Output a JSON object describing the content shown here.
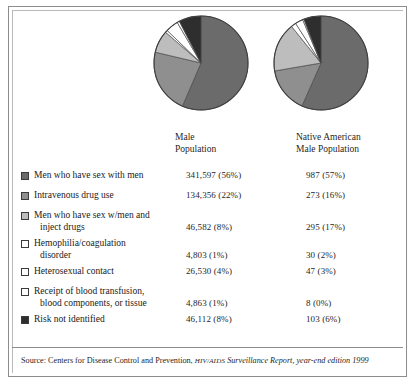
{
  "columns": {
    "male": {
      "line1": "Male",
      "line2": "Population"
    },
    "native_american": {
      "line1": "Native American",
      "line2": "Male Population"
    }
  },
  "rows": [
    {
      "label_line1": "Men who have sex with men",
      "label_line2": "",
      "swatch": "#6b6b6b",
      "male": "341,597 (56%)",
      "native": "987 (57%)"
    },
    {
      "label_line1": "Intravenous drug use",
      "label_line2": "",
      "swatch": "#8f8f8f",
      "male": "134,356 (22%)",
      "native": "273 (16%)"
    },
    {
      "label_line1": "Men who have sex w/men and",
      "label_line2": "inject drugs",
      "swatch": "#bdbdbd",
      "male": "46,582 (8%)",
      "native": "295 (17%)"
    },
    {
      "label_line1": "Hemophilia/coagulation",
      "label_line2": "disorder",
      "swatch": "#ffffff",
      "male": "4,803 (1%)",
      "native": "30 (2%)"
    },
    {
      "label_line1": "Heterosexual contact",
      "label_line2": "",
      "swatch": "#ffffff",
      "male": "26,530 (4%)",
      "native": "47 (3%)"
    },
    {
      "label_line1": "Receipt of blood transfusion,",
      "label_line2": "blood components, or tissue",
      "swatch": "#ffffff",
      "male": "4,863 (1%)",
      "native": "8 (0%)"
    },
    {
      "label_line1": "Risk not identified",
      "label_line2": "",
      "swatch": "#2e2e2e",
      "male": "46,112 (8%)",
      "native": "103 (6%)"
    }
  ],
  "source": {
    "prefix": "Source: Centers for Disease Control and Prevention, ",
    "smallcaps": "HIV/AIDS",
    "italic_tail": " Surveillance Report, year-end edition 1999"
  },
  "chart_data": {
    "type": "pie",
    "title": "",
    "legend_position": "below",
    "categories": [
      "Men who have sex with men",
      "Intravenous drug use",
      "Men who have sex w/men and inject drugs",
      "Hemophilia/coagulation disorder",
      "Heterosexual contact",
      "Receipt of blood transfusion, blood components, or tissue",
      "Risk not identified"
    ],
    "colors": [
      "#6b6b6b",
      "#8f8f8f",
      "#bdbdbd",
      "#ffffff",
      "#ffffff",
      "#ffffff",
      "#2e2e2e"
    ],
    "series": [
      {
        "name": "Male Population",
        "counts": [
          341597,
          134356,
          46582,
          4803,
          26530,
          4863,
          46112
        ],
        "percentages": [
          56,
          22,
          8,
          1,
          4,
          1,
          8
        ],
        "labels": [
          "341,597 (56%)",
          "134,356 (22%)",
          "46,582 (8%)",
          "4,803 (1%)",
          "26,530 (4%)",
          "4,863 (1%)",
          "46,112 (8%)"
        ]
      },
      {
        "name": "Native American Male Population",
        "counts": [
          987,
          273,
          295,
          30,
          47,
          8,
          103
        ],
        "percentages": [
          57,
          16,
          17,
          2,
          3,
          0,
          6
        ],
        "labels": [
          "987 (57%)",
          "273 (16%)",
          "295 (17%)",
          "30 (2%)",
          "47 (3%)",
          "8 (0%)",
          "103 (6%)"
        ]
      }
    ],
    "start_angle_deg": 0,
    "direction": "clockwise"
  }
}
